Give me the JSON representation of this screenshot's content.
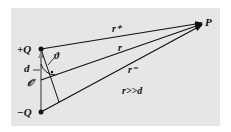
{
  "diagram": {
    "background_color": "#e6e6e6",
    "line_color": "#111111",
    "dipole_arrow_color": "#8a8a8a",
    "labels": {
      "plus_charge": "+Q",
      "minus_charge": "−Q",
      "separation": "d",
      "origin": "𝒪",
      "angle": "ϑ",
      "point": "P",
      "r_plus": "r⁺",
      "r": "r",
      "r_minus": "r⁻",
      "condition": "r>>d"
    }
  }
}
